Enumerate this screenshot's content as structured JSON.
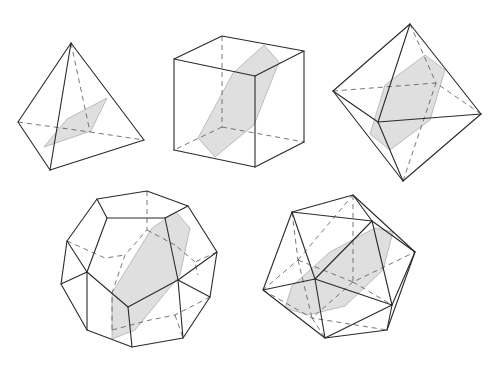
{
  "figure": {
    "colors": {
      "edge": "#2a2a2a",
      "hidden_edge": "#555555",
      "section_fill": "#d9d9d9",
      "background": "#ffffff"
    },
    "solids": [
      {
        "name": "tetrahedron",
        "visible_edges": [
          [
            [
              71,
              43
            ],
            [
              18,
              122
            ]
          ],
          [
            [
              71,
              43
            ],
            [
              50,
              170
            ]
          ],
          [
            [
              71,
              43
            ],
            [
              144,
              140
            ]
          ],
          [
            [
              18,
              122
            ],
            [
              50,
              170
            ]
          ],
          [
            [
              50,
              170
            ],
            [
              144,
              140
            ]
          ]
        ],
        "hidden_edges": [
          [
            [
              18,
              122
            ],
            [
              90,
              132
            ]
          ],
          [
            [
              90,
              132
            ],
            [
              144,
              140
            ]
          ],
          [
            [
              71,
              43
            ],
            [
              90,
              132
            ]
          ]
        ],
        "section": [
          [
            44,
            147
          ],
          [
            67,
            119
          ],
          [
            107,
            98
          ],
          [
            91,
            131
          ]
        ]
      },
      {
        "name": "cube",
        "visible_edges": [
          [
            [
              174,
              59
            ],
            [
              222,
              36
            ]
          ],
          [
            [
              222,
              36
            ],
            [
              304,
              51
            ]
          ],
          [
            [
              304,
              51
            ],
            [
              255,
              76
            ]
          ],
          [
            [
              255,
              76
            ],
            [
              174,
              59
            ]
          ],
          [
            [
              174,
              59
            ],
            [
              174,
              150
            ]
          ],
          [
            [
              255,
              76
            ],
            [
              255,
              167
            ]
          ],
          [
            [
              304,
              51
            ],
            [
              304,
              142
            ]
          ],
          [
            [
              174,
              150
            ],
            [
              255,
              167
            ]
          ],
          [
            [
              255,
              167
            ],
            [
              304,
              142
            ]
          ]
        ],
        "hidden_edges": [
          [
            [
              222,
              36
            ],
            [
              222,
              127
            ]
          ],
          [
            [
              222,
              127
            ],
            [
              174,
              150
            ]
          ],
          [
            [
              222,
              127
            ],
            [
              304,
              142
            ]
          ]
        ],
        "section": [
          [
            264,
            45
          ],
          [
            279,
            62
          ],
          [
            254,
            125
          ],
          [
            215,
            157
          ],
          [
            198,
            138
          ],
          [
            233,
            73
          ]
        ]
      },
      {
        "name": "octahedron",
        "visible_edges": [
          [
            [
              410,
              24
            ],
            [
              333,
              91
            ]
          ],
          [
            [
              410,
              24
            ],
            [
              378,
              122
            ]
          ],
          [
            [
              410,
              24
            ],
            [
              481,
              114
            ]
          ],
          [
            [
              333,
              91
            ],
            [
              378,
              122
            ]
          ],
          [
            [
              378,
              122
            ],
            [
              481,
              114
            ]
          ],
          [
            [
              333,
              91
            ],
            [
              403,
              181
            ]
          ],
          [
            [
              378,
              122
            ],
            [
              403,
              181
            ]
          ],
          [
            [
              481,
              114
            ],
            [
              403,
              181
            ]
          ]
        ],
        "hidden_edges": [
          [
            [
              410,
              24
            ],
            [
              436,
              83
            ]
          ],
          [
            [
              333,
              91
            ],
            [
              436,
              83
            ]
          ],
          [
            [
              481,
              114
            ],
            [
              436,
              83
            ]
          ],
          [
            [
              403,
              181
            ],
            [
              436,
              83
            ]
          ]
        ],
        "section": [
          [
            425,
            55
          ],
          [
            445,
            70
          ],
          [
            430,
            120
          ],
          [
            390,
            150
          ],
          [
            370,
            134
          ],
          [
            385,
            85
          ]
        ]
      },
      {
        "name": "dodecahedron",
        "outer": [
          [
            97,
            199
          ],
          [
            147,
            191
          ],
          [
            188,
            206
          ],
          [
            217,
            252
          ],
          [
            210,
            297
          ],
          [
            183,
            338
          ],
          [
            132,
            347
          ],
          [
            87,
            330
          ],
          [
            61,
            284
          ],
          [
            67,
            241
          ]
        ],
        "inner_front": [
          [
            107,
            218
          ],
          [
            165,
            218
          ],
          [
            178,
            280
          ],
          [
            128,
            307
          ],
          [
            87,
            272
          ]
        ],
        "section": [
          [
            176,
            212
          ],
          [
            190,
            228
          ],
          [
            180,
            275
          ],
          [
            135,
            330
          ],
          [
            112,
            339
          ],
          [
            112,
            293
          ],
          [
            152,
            228
          ]
        ]
      },
      {
        "name": "icosahedron",
        "vertices": {
          "top": [
            353,
            195
          ],
          "ul": [
            292,
            212
          ],
          "ur": [
            372,
            221
          ],
          "r": [
            415,
            252
          ],
          "l": [
            263,
            290
          ],
          "c": [
            315,
            279
          ],
          "lr": [
            392,
            305
          ],
          "br": [
            387,
            330
          ],
          "b": [
            325,
            338
          ]
        },
        "section": [
          [
            375,
            228
          ],
          [
            393,
            232
          ],
          [
            383,
            270
          ],
          [
            345,
            306
          ],
          [
            308,
            315
          ],
          [
            285,
            308
          ],
          [
            292,
            286
          ],
          [
            330,
            252
          ]
        ]
      }
    ]
  }
}
